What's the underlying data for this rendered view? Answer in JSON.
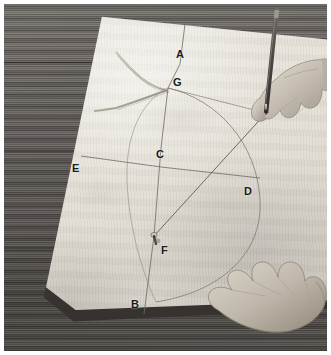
{
  "photo": {
    "title": "Drawing an elliptical arc on a plywood board",
    "description": "Black and white photograph of two hands on a plywood sheet laid on a dark wooden table; the right hand guides a pencil along a bent wooden batten while the left hand steadies the board. Construction points are lettered A through G.",
    "width": 331,
    "height": 355,
    "frame_color": "#ffffff"
  },
  "scene": {
    "table": {
      "name": "wooden table",
      "color": "#5e5955"
    },
    "board": {
      "name": "plywood board",
      "color": "#e6e2da",
      "edge_color": "#3a3734"
    },
    "pencil": {
      "name": "pencil",
      "body_color": "#4a4744",
      "ferrule_color": "#8d8a86",
      "tip_color": "#2a2724"
    },
    "nail": {
      "name": "nail at point F",
      "color": "#3b3835"
    },
    "batten": {
      "name": "bent wooden batten",
      "color": "#b9b3a8"
    }
  },
  "labels": [
    {
      "id": "A",
      "text": "A",
      "x": 172,
      "y": 45,
      "note": "top end of vertical axis"
    },
    {
      "id": "G",
      "text": "G",
      "x": 169,
      "y": 73,
      "note": "apex of the curve"
    },
    {
      "id": "C",
      "text": "C",
      "x": 152,
      "y": 145,
      "note": "centre, intersection of axes"
    },
    {
      "id": "E",
      "text": "E",
      "x": 68,
      "y": 159,
      "note": "left end of horizontal axis"
    },
    {
      "id": "D",
      "text": "D",
      "x": 240,
      "y": 182,
      "note": "right end of horizontal axis"
    },
    {
      "id": "F",
      "text": "F",
      "x": 157,
      "y": 241,
      "note": "focus, marked with a nail"
    },
    {
      "id": "B",
      "text": "B",
      "x": 127,
      "y": 295,
      "note": "bottom end of vertical axis"
    }
  ],
  "geometry": {
    "type": "ellipse-construction",
    "axis_vertical": {
      "from": "A",
      "to": "B"
    },
    "axis_horizontal": {
      "from": "E",
      "to": "D"
    },
    "centre": "C",
    "focus": "F",
    "apex": "G",
    "arc_drawn_with": "pencil guided along bent batten"
  },
  "hands": [
    {
      "id": "right-hand",
      "name": "hand holding pencil",
      "position": "upper right"
    },
    {
      "id": "left-hand",
      "name": "hand steadying board",
      "position": "lower right"
    }
  ]
}
